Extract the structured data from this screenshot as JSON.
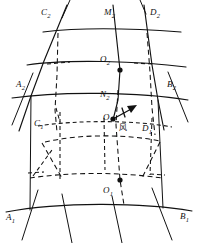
{
  "figure": {
    "type": "geometric-diagram",
    "background_color": "#ffffff",
    "line_color": "#111111",
    "labels": [
      {
        "id": "C2",
        "text": "C",
        "sub": "2",
        "x": 41,
        "y": 8,
        "kind": "vertex"
      },
      {
        "id": "M2",
        "text": "M",
        "sub": "2",
        "x": 104,
        "y": 8,
        "kind": "vertex"
      },
      {
        "id": "D2",
        "text": "D",
        "sub": "2",
        "x": 150,
        "y": 8,
        "kind": "vertex"
      },
      {
        "id": "O2",
        "text": "O",
        "sub": "2",
        "x": 100,
        "y": 55,
        "kind": "center"
      },
      {
        "id": "A2",
        "text": "A",
        "sub": "2",
        "x": 16,
        "y": 80,
        "kind": "vertex"
      },
      {
        "id": "B2",
        "text": "B",
        "sub": "2",
        "x": 167,
        "y": 80,
        "kind": "vertex"
      },
      {
        "id": "N2",
        "text": "N",
        "sub": "2",
        "x": 100,
        "y": 90,
        "kind": "vertex"
      },
      {
        "id": "O",
        "text": "O",
        "sub": "",
        "x": 103,
        "y": 113,
        "kind": "center"
      },
      {
        "id": "C1",
        "text": "C",
        "sub": "1",
        "x": 34,
        "y": 119,
        "kind": "vertex"
      },
      {
        "id": "D1",
        "text": "D",
        "sub": "1",
        "x": 142,
        "y": 124,
        "kind": "vertex"
      },
      {
        "id": "O1",
        "text": "O",
        "sub": "1",
        "x": 103,
        "y": 186,
        "kind": "center"
      },
      {
        "id": "A1",
        "text": "A",
        "sub": "1",
        "x": 6,
        "y": 213,
        "kind": "vertex"
      },
      {
        "id": "B1",
        "text": "B",
        "sub": "1",
        "x": 180,
        "y": 212,
        "kind": "vertex"
      }
    ],
    "annotation": {
      "wind_label": "风",
      "wind_label_x": 119,
      "wind_label_y": 124,
      "arrow_from_x": 113,
      "arrow_from_y": 119,
      "arrow_to_x": 136,
      "arrow_to_y": 107
    },
    "nodes": [
      {
        "id": "O2-dot",
        "x": 120,
        "y": 70
      },
      {
        "id": "O-dot",
        "x": 113,
        "y": 119
      },
      {
        "id": "O1-dot",
        "x": 120,
        "y": 180
      }
    ]
  }
}
